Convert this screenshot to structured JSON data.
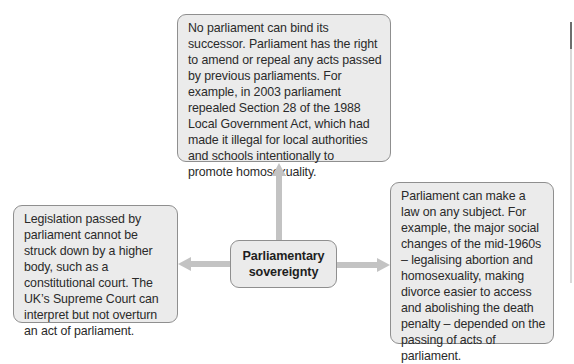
{
  "diagram": {
    "center": {
      "label": "Parliamentary\nsovereignty"
    },
    "branches": {
      "top": {
        "text": "No parliament can bind its successor. Parliament has the right to amend or repeal any acts passed by previous parliaments. For example, in 2003 parliament repealed Section 28 of the 1988 Local Government Act, which had made it illegal for local authorities and schools intentionally to promote homosexuality."
      },
      "left": {
        "text": "Legislation passed by parliament cannot be struck down by a higher body, such as a constitutional court. The UK’s Supreme Court can interpret but not overturn an act of parliament."
      },
      "right": {
        "text": "Parliament can make a law on any subject. For example, the major social changes of the mid-1960s – legalising abortion and homosexuality, making divorce easier to access and abolishing the death penalty – depended on the passing of acts of parliament."
      }
    },
    "arrows": [
      {
        "from": "center",
        "to": "top",
        "direction": "up"
      },
      {
        "from": "center",
        "to": "left",
        "direction": "left"
      },
      {
        "from": "center",
        "to": "right",
        "direction": "right"
      }
    ],
    "colors": {
      "box_fill": "#ebebeb",
      "box_border": "#8f8f8f",
      "arrow": "#c3c3c3",
      "text": "#2a2a2a"
    }
  }
}
